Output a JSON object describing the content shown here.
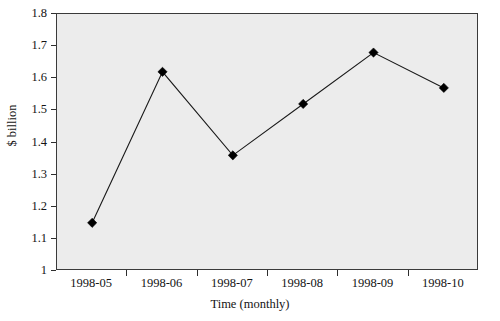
{
  "chart_data": {
    "type": "line",
    "title": "",
    "xlabel": "Time (monthly)",
    "ylabel": "$ billion",
    "categories": [
      "1998-05",
      "1998-06",
      "1998-07",
      "1998-08",
      "1998-09",
      "1998-10"
    ],
    "values": [
      1.15,
      1.62,
      1.36,
      1.52,
      1.68,
      1.57
    ],
    "series": [
      {
        "name": "$ billion",
        "values": [
          1.15,
          1.62,
          1.36,
          1.52,
          1.68,
          1.57
        ]
      }
    ],
    "ylim": [
      1,
      1.8
    ],
    "y_ticks": [
      "1.8",
      "1.7",
      "1.6",
      "1.5",
      "1.4",
      "1.3",
      "1.2",
      "1.1",
      "1"
    ],
    "y_tick_values": [
      1.8,
      1.7,
      1.6,
      1.5,
      1.4,
      1.3,
      1.2,
      1.1,
      1.0
    ],
    "y_tick_step": 0.1,
    "grid": false,
    "legend": "none",
    "marker": "diamond",
    "marker_color": "#000000",
    "line_color": "#1a1a1a",
    "plot_background": "#ececec",
    "frame_color": "#3a3a3a"
  }
}
